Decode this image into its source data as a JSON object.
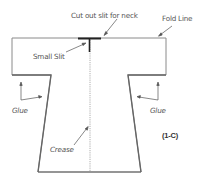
{
  "diagram": {
    "labels": {
      "neck": "Cut out slit for neck",
      "fold": "Fold Line",
      "slit": "Small Slit",
      "glue_left": "Glue",
      "glue_right": "Glue",
      "crease": "Crease",
      "figure_id": "(1-C)"
    },
    "colors": {
      "outline": "#888888",
      "thick_outline": "#666666",
      "slit": "#222222",
      "crease": "#999999"
    }
  }
}
